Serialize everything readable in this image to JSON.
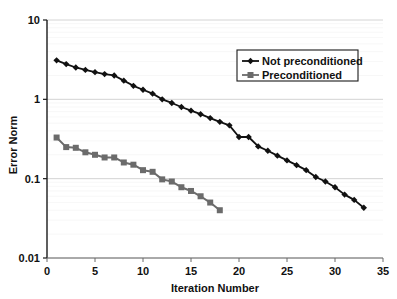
{
  "chart_data": {
    "type": "line",
    "title": "",
    "xlabel": "Iteration Number",
    "ylabel": "Error Norm",
    "xlim": [
      0,
      35
    ],
    "ylim": [
      0.01,
      10
    ],
    "yscale": "log",
    "xticks": [
      0,
      5,
      10,
      15,
      20,
      25,
      30,
      35
    ],
    "xtick_labels": [
      "0",
      "5",
      "10",
      "15",
      "20",
      "25",
      "30",
      "35"
    ],
    "yticks": [
      0.01,
      0.1,
      1,
      10
    ],
    "ytick_labels": [
      "0.01",
      "0.1",
      "1",
      "10"
    ],
    "grid": "horizontal-major",
    "legend_position": "upper-right",
    "series": [
      {
        "name": "Not preconditioned",
        "color": "#111111",
        "marker": "diamond",
        "x": [
          1,
          2,
          3,
          4,
          5,
          6,
          7,
          8,
          9,
          10,
          11,
          12,
          13,
          14,
          15,
          16,
          17,
          18,
          19,
          20,
          21,
          22,
          23,
          24,
          25,
          26,
          27,
          28,
          29,
          30,
          31,
          32,
          33
        ],
        "values": [
          3.1,
          2.78,
          2.52,
          2.35,
          2.2,
          2.08,
          2.0,
          1.72,
          1.48,
          1.32,
          1.18,
          1.0,
          0.9,
          0.8,
          0.72,
          0.65,
          0.58,
          0.52,
          0.47,
          0.335,
          0.335,
          0.255,
          0.225,
          0.195,
          0.17,
          0.148,
          0.128,
          0.105,
          0.092,
          0.078,
          0.063,
          0.054,
          0.043
        ]
      },
      {
        "name": "Preconditioned",
        "color": "#6b6b6b",
        "marker": "square",
        "x": [
          1,
          2,
          3,
          4,
          5,
          6,
          7,
          8,
          9,
          10,
          11,
          12,
          13,
          14,
          15,
          16,
          17,
          18
        ],
        "values": [
          0.33,
          0.25,
          0.245,
          0.215,
          0.2,
          0.185,
          0.185,
          0.16,
          0.15,
          0.128,
          0.122,
          0.098,
          0.092,
          0.078,
          0.07,
          0.06,
          0.05,
          0.04
        ]
      }
    ]
  },
  "axes": {
    "x_title": "Iteration Number",
    "y_title": "Error Norm"
  },
  "legend": {
    "entries": [
      {
        "label": "Not preconditioned"
      },
      {
        "label": "Preconditioned"
      }
    ]
  }
}
